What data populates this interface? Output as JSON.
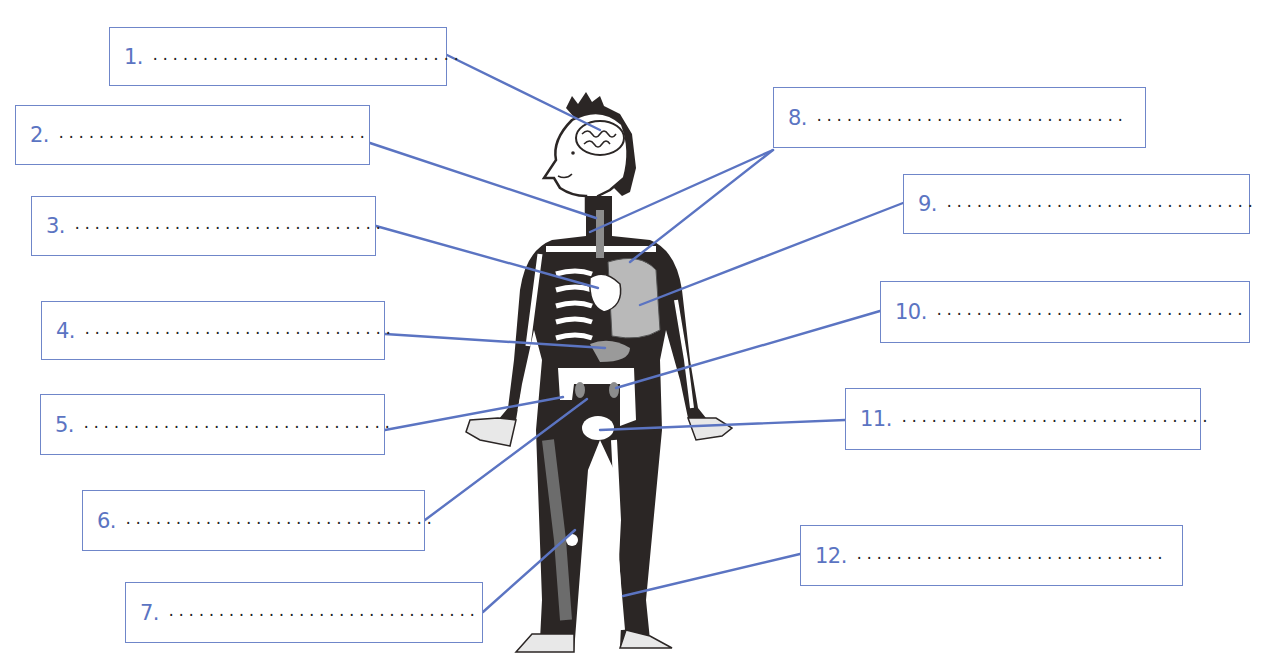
{
  "diagram": {
    "title": "",
    "colors": {
      "box_border": "#6f86c9",
      "number_text": "#5b74c2",
      "leader_line": "#5b74c2",
      "body_fill": "#2b2625",
      "organ_fill": "#bdbdbd"
    }
  },
  "labels": [
    {
      "num": "1.",
      "blank": "...............................",
      "box": [
        109,
        27,
        338,
        59
      ],
      "line": [
        [
          447,
          55
        ],
        [
          600,
          130
        ]
      ]
    },
    {
      "num": "2.",
      "blank": "...............................",
      "box": [
        15,
        105,
        355,
        60
      ],
      "line": [
        [
          370,
          143
        ],
        [
          596,
          218
        ]
      ]
    },
    {
      "num": "3.",
      "blank": "...............................",
      "box": [
        31,
        196,
        345,
        60
      ],
      "line": [
        [
          376,
          226
        ],
        [
          598,
          288
        ]
      ]
    },
    {
      "num": "4.",
      "blank": "...............................",
      "box": [
        41,
        301,
        344,
        59
      ],
      "line": [
        [
          385,
          334
        ],
        [
          605,
          348
        ]
      ]
    },
    {
      "num": "5.",
      "blank": "...............................",
      "box": [
        40,
        394,
        345,
        61
      ],
      "line": [
        [
          385,
          430
        ],
        [
          563,
          397
        ]
      ]
    },
    {
      "num": "6.",
      "blank": "...............................",
      "box": [
        82,
        490,
        343,
        61
      ],
      "line": [
        [
          425,
          520
        ],
        [
          587,
          399
        ]
      ]
    },
    {
      "num": "7.",
      "blank": "...............................",
      "box": [
        125,
        582,
        358,
        61
      ],
      "line": [
        [
          483,
          612
        ],
        [
          575,
          530
        ]
      ]
    },
    {
      "num": "8.",
      "blank": "...............................",
      "box": [
        773,
        87,
        373,
        61
      ],
      "lines": [
        [
          [
            773,
            150
          ],
          [
            590,
            232
          ]
        ],
        [
          [
            773,
            150
          ],
          [
            630,
            262
          ]
        ]
      ]
    },
    {
      "num": "9.",
      "blank": "...............................",
      "box": [
        903,
        174,
        347,
        60
      ],
      "line": [
        [
          903,
          203
        ],
        [
          640,
          305
        ]
      ]
    },
    {
      "num": "10.",
      "blank": "...............................",
      "box": [
        880,
        281,
        370,
        62
      ],
      "line": [
        [
          880,
          311
        ],
        [
          616,
          388
        ]
      ]
    },
    {
      "num": "11.",
      "blank": "...............................",
      "box": [
        845,
        388,
        356,
        62
      ],
      "line": [
        [
          845,
          420
        ],
        [
          600,
          430
        ]
      ]
    },
    {
      "num": "12.",
      "blank": "...............................",
      "box": [
        800,
        525,
        383,
        61
      ],
      "line": [
        [
          800,
          554
        ],
        [
          623,
          596
        ]
      ]
    }
  ]
}
